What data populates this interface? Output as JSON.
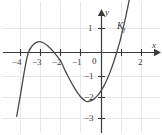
{
  "figure": {
    "background_color": "#ffffff",
    "ink_color": "#3a3a3a",
    "grid_color": "#e4e6ef",
    "width_px": 162,
    "height_px": 135
  },
  "axes": {
    "x_axis_label": "x",
    "y_axis_label": "y",
    "origin_label": "0",
    "x_ticks": [
      {
        "value": -4,
        "label": "−4"
      },
      {
        "value": -3,
        "label": "−3"
      },
      {
        "value": -2,
        "label": "−2"
      },
      {
        "value": -1,
        "label": "−1"
      },
      {
        "value": 1,
        "label": ""
      },
      {
        "value": 2,
        "label": "2"
      }
    ],
    "y_ticks": [
      {
        "value": 1,
        "label": "1"
      },
      {
        "value": -1,
        "label": "−1"
      },
      {
        "value": -2,
        "label": "−2"
      },
      {
        "value": -3,
        "label": "−3"
      }
    ]
  },
  "curve": {
    "name_label": "K",
    "name_subscript": "f",
    "stroke_color": "#4a4a4a"
  },
  "chart_data": {
    "type": "line",
    "title": "",
    "xlabel": "x",
    "ylabel": "y",
    "xlim": [
      -4.8,
      2.6
    ],
    "ylim": [
      -3.6,
      1.6
    ],
    "grid": true,
    "legend": "K_f",
    "annotations": [
      "K_f"
    ],
    "xtick_labels": [
      "−4",
      "−3",
      "−2",
      "−1",
      "0",
      "",
      "2"
    ],
    "xtick_values": [
      -4,
      -3,
      -2,
      -1,
      0,
      1,
      2
    ],
    "ytick_labels": [
      "1",
      "0",
      "−1",
      "−2",
      "−3"
    ],
    "ytick_values": [
      1,
      0,
      -1,
      -2,
      -3
    ],
    "series": [
      {
        "name": "K_f",
        "roots": [
          -3.62,
          -2.0,
          0.92
        ],
        "local_max": {
          "x": -3.0,
          "y": 0.45
        },
        "local_min": {
          "x": -0.72,
          "y": -2.12
        },
        "x": [
          -4.2,
          -4.0,
          -3.8,
          -3.62,
          -3.4,
          -3.2,
          -3.0,
          -2.8,
          -2.6,
          -2.4,
          -2.2,
          -2.0,
          -1.8,
          -1.6,
          -1.4,
          -1.2,
          -1.0,
          -0.8,
          -0.72,
          -0.6,
          -0.4,
          -0.2,
          0.0,
          0.2,
          0.4,
          0.6,
          0.8,
          0.92,
          1.0,
          1.2,
          1.4,
          1.5
        ],
        "y": [
          -2.75,
          -1.76,
          -0.72,
          0.0,
          0.32,
          0.45,
          0.46,
          0.38,
          0.24,
          0.06,
          -0.16,
          -0.4,
          -0.78,
          -1.12,
          -1.44,
          -1.72,
          -1.94,
          -2.09,
          -2.12,
          -2.1,
          -2.02,
          -1.86,
          -1.62,
          -1.3,
          -0.9,
          -0.42,
          0.14,
          0.5,
          0.8,
          1.54,
          2.38,
          2.84
        ]
      }
    ]
  }
}
